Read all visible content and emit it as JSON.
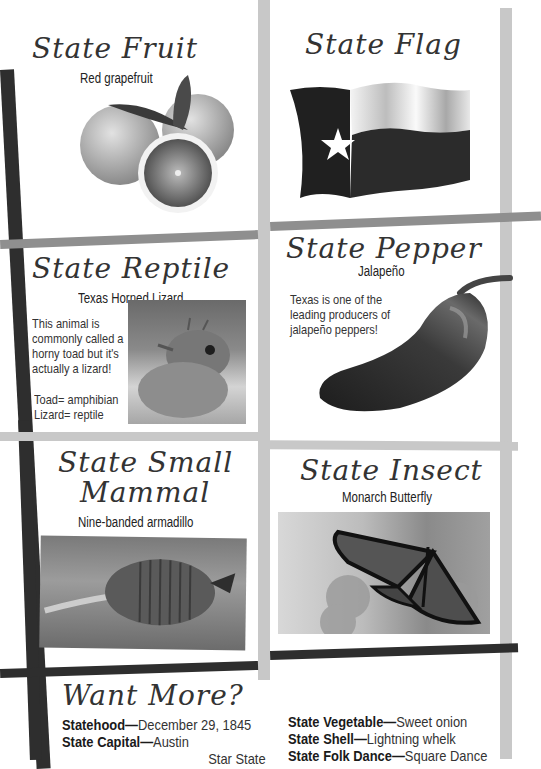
{
  "panels": {
    "fruit": {
      "title": "State Fruit",
      "subtitle": "Red grapefruit",
      "image": "grapefruit-photo"
    },
    "flag": {
      "title": "State Flag",
      "image": "texas-flag-photo"
    },
    "reptile": {
      "title": "State Reptile",
      "subtitle": "Texas Horned Lizard",
      "text": "This animal is commonly called a horny toad but it's actually a lizard!",
      "note_1": "Toad= amphibian",
      "note_2": "Lizard= reptile",
      "image": "horned-lizard-photo"
    },
    "pepper": {
      "title": "State Pepper",
      "subtitle": "Jalapeño",
      "text": "Texas is one of the leading producers of jalapeño peppers!",
      "image": "jalapeno-photo"
    },
    "mammal": {
      "title_line1": "State Small",
      "title_line2": "Mammal",
      "subtitle": "Nine-banded armadillo",
      "image": "armadillo-photo"
    },
    "insect": {
      "title": "State Insect",
      "subtitle": "Monarch Butterfly",
      "image": "monarch-butterfly-photo"
    }
  },
  "want_more": {
    "title": "Want More?",
    "left_facts": [
      {
        "label": "Statehood",
        "sep": "—",
        "value": "December 29, 1845"
      },
      {
        "label": "State Capital",
        "sep": "—",
        "value": "Austin"
      },
      {
        "label": "",
        "sep": "",
        "value": "Star State"
      }
    ],
    "right_facts": [
      {
        "label": "State Vegetable",
        "sep": "—",
        "value": "Sweet onion"
      },
      {
        "label": "State Shell",
        "sep": "—",
        "value": "Lightning whelk"
      },
      {
        "label": "State Folk Dance",
        "sep": "—",
        "value": "Square Dance"
      }
    ]
  },
  "colors": {
    "dark_bar": "#2e2e2e",
    "mid_bar": "#8f8f8f",
    "light_bar": "#c8c8c8",
    "background": "#ffffff"
  }
}
